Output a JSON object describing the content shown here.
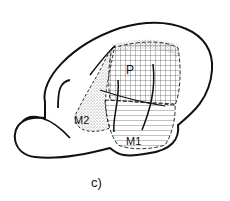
{
  "figure": {
    "panel_label": "c)",
    "regions": [
      {
        "id": "P",
        "label": "P",
        "pattern": "grid"
      },
      {
        "id": "M1",
        "label": "M1",
        "pattern": "horizontal-lines"
      },
      {
        "id": "M2",
        "label": "M2",
        "pattern": "stipple"
      }
    ]
  },
  "colors": {
    "ink": "#111111",
    "background": "#ffffff"
  }
}
